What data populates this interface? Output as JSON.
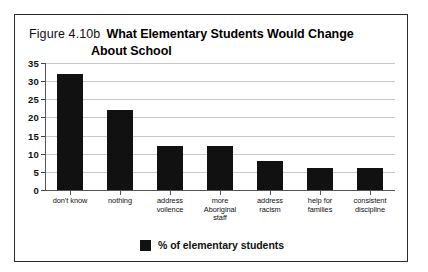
{
  "figure": {
    "number_label": "Figure 4.10b",
    "title_line1": "What Elementary Students Would Change",
    "title_line2": "About School"
  },
  "legend": {
    "swatch_color": "#111111",
    "label": "% of elementary students"
  },
  "colors": {
    "bar": "#111111",
    "gridline": "#c8c8c8",
    "axis": "#555555",
    "frame": "#2b2b2b",
    "text": "#111111"
  },
  "chart_data": {
    "type": "bar",
    "xlabel": "",
    "ylabel": "",
    "ylim": [
      0,
      35
    ],
    "yticks": [
      0,
      5,
      10,
      15,
      20,
      25,
      30,
      35
    ],
    "ytick_labels": [
      "0",
      "5",
      "10",
      "15",
      "20",
      "25",
      "30",
      "35"
    ],
    "grid": true,
    "legend_position": "bottom-center",
    "categories": [
      "don't know",
      "nothing",
      "address voilence",
      "more Aboriginal staff",
      "address racism",
      "help for families",
      "consistent discipline"
    ],
    "category_lines": [
      [
        "don't know"
      ],
      [
        "nothing"
      ],
      [
        "address",
        "voilence"
      ],
      [
        "more",
        "Aboriginal",
        "staff"
      ],
      [
        "address",
        "racism"
      ],
      [
        "help for",
        "families"
      ],
      [
        "consistent",
        "discipline"
      ]
    ],
    "series": [
      {
        "name": "% of elementary students",
        "values": [
          32,
          22,
          12,
          12,
          8,
          6,
          6
        ]
      }
    ]
  }
}
